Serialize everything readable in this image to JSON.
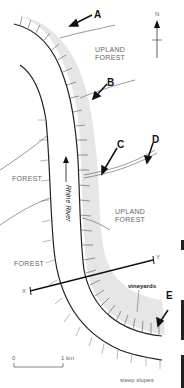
{
  "map": {
    "labels": {
      "upland_forest_top": "UPLAND\nFOREST",
      "upland_forest_mid": "UPLAND\nFOREST",
      "forest_left": "FOREST",
      "forest_bottom_left": "FOREST",
      "river": "Rhine River",
      "vineyards": "vineyards",
      "steep_slopes": "steep slopes"
    },
    "markers": [
      "A",
      "B",
      "C",
      "D",
      "E"
    ],
    "compass": {
      "north": "N"
    },
    "transect": {
      "start": "X",
      "end": "Y"
    },
    "scale": {
      "zero": "0",
      "unit": "1 km"
    },
    "colors": {
      "slope_shade": "#e4e4e4",
      "line": "#222222",
      "hachure": "#555555"
    }
  }
}
